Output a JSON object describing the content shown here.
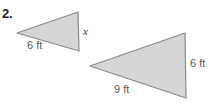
{
  "problem": {
    "number": "2."
  },
  "figure": {
    "style": {
      "fill": "#d6d6d6",
      "stroke": "#8a8a8a",
      "stroke_width": 1.2,
      "background": "#ffffff"
    },
    "triangles": [
      {
        "id": "small-triangle",
        "name": "triangle-1",
        "points": "17,33 78,12 79,51",
        "labels": {
          "base": "6 ft",
          "right": "x"
        }
      },
      {
        "id": "large-triangle",
        "name": "triangle-2",
        "points": "90,66 185,33 186,98",
        "labels": {
          "base": "9 ft",
          "right": "6 ft"
        }
      }
    ]
  },
  "chart_data": {
    "type": "diagram",
    "shapes": [
      {
        "shape": "triangle",
        "label": "small triangle",
        "vertices": [
          [
            17,
            33
          ],
          [
            78,
            12
          ],
          [
            79,
            51
          ]
        ],
        "side_labels": [
          {
            "side": "lower-left",
            "text": "6 ft",
            "value": 6,
            "unit": "ft"
          },
          {
            "side": "right-vertical",
            "text": "x",
            "value": null,
            "unit": "ft"
          }
        ]
      },
      {
        "shape": "triangle",
        "label": "large triangle",
        "vertices": [
          [
            90,
            66
          ],
          [
            185,
            33
          ],
          [
            186,
            98
          ]
        ],
        "side_labels": [
          {
            "side": "lower-left",
            "text": "9 ft",
            "value": 9,
            "unit": "ft"
          },
          {
            "side": "right-vertical",
            "text": "6 ft",
            "value": 6,
            "unit": "ft"
          }
        ]
      }
    ]
  }
}
